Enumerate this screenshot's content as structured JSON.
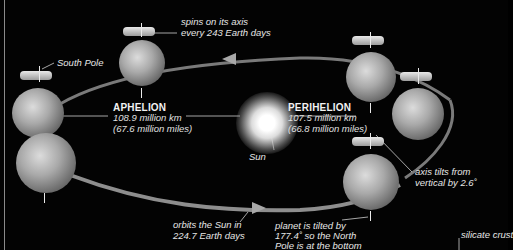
{
  "diagram": {
    "aphelion": {
      "title": "APHELION",
      "km": "108.9 million km",
      "miles": "(67.6 million miles)"
    },
    "perihelion": {
      "title": "PERIHELION",
      "km": "107.5 million km",
      "miles": "(66.8 million miles)"
    },
    "labels": {
      "spin_line1": "spins on its axis",
      "spin_line2": "every 243 Earth days",
      "south_pole": "South Pole",
      "sun": "Sun",
      "axis_tilt_line1": "axis tilts from",
      "axis_tilt_line2": "vertical by 2.6˚",
      "orbit_line1": "orbits the Sun in",
      "orbit_line2": "224.7 Earth days",
      "planet_tilt_line1": "planet is tilted by",
      "planet_tilt_line2": "177.4˚ so the North",
      "planet_tilt_line3": "Pole is at the bottom",
      "silicate_crust": "silicate crust"
    },
    "colors": {
      "background": "#030303",
      "orbit": "#8e8e8e",
      "text": "#e6e6e6"
    }
  }
}
